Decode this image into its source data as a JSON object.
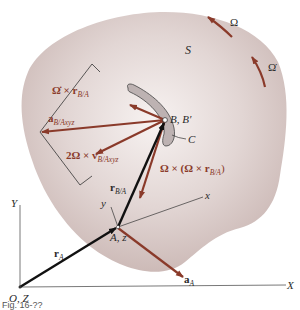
{
  "figure": {
    "region_label": "S",
    "curve_label": "C",
    "point_B_label": "B, B′",
    "point_A_label": "A, z",
    "origin_label": "O, Z",
    "axis_X_label": "X",
    "axis_Y_label": "Y",
    "axis_x_label": "x",
    "axis_y_label": "y",
    "omega_label": "Ω",
    "omega_dot_label": "Ω̇",
    "caption": "Fig. 16-??"
  },
  "vectors": {
    "r_A": {
      "main": "r",
      "sub": "A"
    },
    "r_BA": {
      "main": "r",
      "sub": "B/A"
    },
    "a_A": {
      "main": "a",
      "sub": "A"
    },
    "a_BAxyz": {
      "main": "a",
      "sub": "B/Axyz"
    },
    "omegadot_cross_r": {
      "main": "Ω̇ × r",
      "sub": "B/A"
    },
    "coriolis": {
      "main": "2Ω × v",
      "sub": "B/Axyz"
    },
    "centripetal": {
      "main": "Ω × (Ω × r",
      "sub": "B/A",
      "tail": ")"
    }
  },
  "colors": {
    "body_fill": "#d9cbc8",
    "vector_brown": "#8a3a2a",
    "vector_black": "#111111",
    "line_gray": "#333333"
  }
}
